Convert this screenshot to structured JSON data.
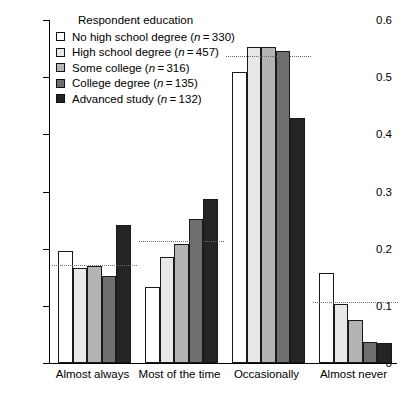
{
  "chart_data": {
    "type": "bar",
    "title": "",
    "xlabel": "",
    "ylabel": "",
    "ylim": [
      0,
      0.6
    ],
    "yticks": [
      "0",
      "0.1",
      "0.2",
      "0.3",
      "0.4",
      "0.5",
      "0.6"
    ],
    "ytick_values": [
      0,
      0.1,
      0.2,
      0.3,
      0.4,
      0.5,
      0.6
    ],
    "grid": false,
    "legend_position": "top-left",
    "legend_title": "Respondent education",
    "categories": [
      "Almost always",
      "Most of the time",
      "Occasionally",
      "Almost never"
    ],
    "series": [
      {
        "name": "No high school degree",
        "n": 330,
        "label": "No high school degree (n = 330)",
        "color": "#ffffff",
        "values": [
          0.196,
          0.133,
          0.509,
          0.157
        ]
      },
      {
        "name": "High school degree",
        "n": 457,
        "label": "High school degree (n = 457)",
        "color": "#e8e8e8",
        "values": [
          0.166,
          0.185,
          0.553,
          0.103
        ]
      },
      {
        "name": "Some college",
        "n": 316,
        "label": "Some college (n = 316)",
        "color": "#b4b4b4",
        "values": [
          0.17,
          0.208,
          0.553,
          0.075
        ]
      },
      {
        "name": "College degree",
        "n": 135,
        "label": "College degree (n = 135)",
        "color": "#6e6e6e",
        "values": [
          0.153,
          0.252,
          0.546,
          0.037
        ]
      },
      {
        "name": "Advanced study",
        "n": 132,
        "label": "Advanced study (n = 132)",
        "color": "#242424",
        "values": [
          0.241,
          0.287,
          0.429,
          0.035
        ]
      }
    ],
    "reference_lines": [
      {
        "category": "Almost always",
        "value": 0.17
      },
      {
        "category": "Most of the time",
        "value": 0.212
      },
      {
        "category": "Occasionally",
        "value": 0.535
      },
      {
        "category": "Almost never",
        "value": 0.105
      }
    ]
  }
}
